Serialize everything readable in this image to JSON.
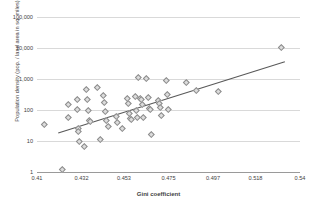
{
  "chart_data": {
    "type": "scatter",
    "title": "",
    "xlabel": "Gini coefficient",
    "ylabel": "Population density (pop. / land area in sq. miles)",
    "xlim": [
      0.41,
      0.54
    ],
    "ylim": [
      1,
      100000
    ],
    "yscale": "log",
    "xscale": "linear",
    "grid": true,
    "legend": false,
    "xticks": [
      "0.41",
      "0.432",
      "0.453",
      "0.475",
      "0.497",
      "0.518",
      "0.54"
    ],
    "xtick_values": [
      0.41,
      0.432,
      0.453,
      0.475,
      0.497,
      0.518,
      0.54
    ],
    "yticks": [
      "1",
      "10",
      "100",
      "1,000",
      "10,000",
      "100,000"
    ],
    "ytick_values": [
      1,
      10,
      100,
      1000,
      10000,
      100000
    ],
    "marker": "diamond",
    "marker_fill": "#dcdcdc",
    "marker_edge": "#8c8c8c",
    "gridline_color": "#d9d9d9",
    "trendline": {
      "present": true,
      "color": "#595959",
      "x": [
        0.4205,
        0.5325
      ],
      "y": [
        18,
        3600
      ]
    },
    "points": [
      {
        "x": 0.4135,
        "y": 35
      },
      {
        "x": 0.4225,
        "y": 1.2
      },
      {
        "x": 0.4255,
        "y": 150
      },
      {
        "x": 0.4255,
        "y": 57
      },
      {
        "x": 0.43,
        "y": 215
      },
      {
        "x": 0.43,
        "y": 108
      },
      {
        "x": 0.4305,
        "y": 26
      },
      {
        "x": 0.4305,
        "y": 20
      },
      {
        "x": 0.431,
        "y": 10
      },
      {
        "x": 0.4335,
        "y": 7
      },
      {
        "x": 0.4345,
        "y": 480
      },
      {
        "x": 0.435,
        "y": 220
      },
      {
        "x": 0.4355,
        "y": 100
      },
      {
        "x": 0.436,
        "y": 45
      },
      {
        "x": 0.4365,
        "y": 44
      },
      {
        "x": 0.44,
        "y": 560
      },
      {
        "x": 0.4415,
        "y": 11
      },
      {
        "x": 0.443,
        "y": 295
      },
      {
        "x": 0.4435,
        "y": 180
      },
      {
        "x": 0.444,
        "y": 88
      },
      {
        "x": 0.4445,
        "y": 45
      },
      {
        "x": 0.445,
        "y": 30
      },
      {
        "x": 0.449,
        "y": 65
      },
      {
        "x": 0.4495,
        "y": 40
      },
      {
        "x": 0.452,
        "y": 26
      },
      {
        "x": 0.4545,
        "y": 230
      },
      {
        "x": 0.455,
        "y": 160
      },
      {
        "x": 0.4555,
        "y": 80
      },
      {
        "x": 0.456,
        "y": 55
      },
      {
        "x": 0.4565,
        "y": 52
      },
      {
        "x": 0.4585,
        "y": 270
      },
      {
        "x": 0.459,
        "y": 95
      },
      {
        "x": 0.4595,
        "y": 60
      },
      {
        "x": 0.46,
        "y": 1150
      },
      {
        "x": 0.461,
        "y": 230
      },
      {
        "x": 0.4615,
        "y": 215
      },
      {
        "x": 0.462,
        "y": 150
      },
      {
        "x": 0.4625,
        "y": 58
      },
      {
        "x": 0.464,
        "y": 1050
      },
      {
        "x": 0.465,
        "y": 250
      },
      {
        "x": 0.4655,
        "y": 115
      },
      {
        "x": 0.466,
        "y": 105
      },
      {
        "x": 0.4665,
        "y": 17
      },
      {
        "x": 0.47,
        "y": 205
      },
      {
        "x": 0.4705,
        "y": 160
      },
      {
        "x": 0.471,
        "y": 120
      },
      {
        "x": 0.4715,
        "y": 70
      },
      {
        "x": 0.474,
        "y": 900
      },
      {
        "x": 0.4745,
        "y": 330
      },
      {
        "x": 0.475,
        "y": 105
      },
      {
        "x": 0.484,
        "y": 760
      },
      {
        "x": 0.4885,
        "y": 430
      },
      {
        "x": 0.4995,
        "y": 410
      },
      {
        "x": 0.531,
        "y": 10500
      }
    ]
  }
}
